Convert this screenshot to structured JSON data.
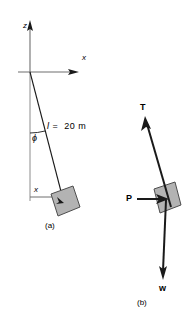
{
  "figure": {
    "kind": "physics-free-body-diagram",
    "background_color": "#ffffff",
    "stroke_color": "#1a1a1a",
    "block_fill_color": "#b3b3b3",
    "block_stroke_color": "#4d4d4d",
    "panel_a": {
      "caption": "(a)",
      "axis_z_label": "z",
      "axis_x_label": "x",
      "angle_label": "ϕ",
      "length_label_symbol": "l",
      "length_label_value": "=  20 m",
      "length_label_full": "l  =  20 m",
      "displacement_label": "x",
      "description": "Pendulum of length l = 20 m suspended from origin, hanging at angle phi from the vertical z axis, with horizontal displacement x"
    },
    "panel_b": {
      "caption": "(b)",
      "vectors": [
        {
          "name": "tension",
          "label": "T",
          "direction": "up-and-to-the-left-along-string"
        },
        {
          "name": "applied-horizontal-force",
          "label": "P",
          "direction": "right"
        },
        {
          "name": "weight",
          "label": "w",
          "direction": "down"
        }
      ],
      "description": "Free-body diagram of the block showing tension T along the string, horizontal force P, and weight w"
    }
  }
}
